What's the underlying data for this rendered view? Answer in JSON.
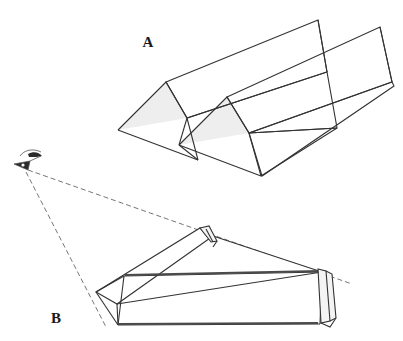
{
  "illustration": {
    "title": "Folded paper geometry figure",
    "background_color": "#ffffff",
    "stroke_color": "#333333",
    "shade_color": "#eeeeee",
    "dash_color": "#666666",
    "labels": {
      "panel_a": "A",
      "panel_b": "B"
    },
    "label_positions": {
      "panel_a": {
        "x": 148,
        "y": 47
      },
      "panel_b": {
        "x": 56,
        "y": 323
      }
    }
  },
  "figure_a": {
    "name": "accordion-fold-figure",
    "description": "Zigzag accordion folded sheet seen in oblique view with two shaded triangular end faces",
    "stroke_width": 1.1,
    "shaded_triangles": [
      {
        "points": "118,130 166,82 187,118"
      },
      {
        "points": "179,145 227,97 249,133"
      }
    ],
    "panels": [
      {
        "name": "rear-upper-panel",
        "points": "166,82 318,20 327,72 187,118"
      },
      {
        "name": "front-valley-panel",
        "points": "118,130 166,82 187,118 198,160"
      },
      {
        "name": "mid-upper-panel",
        "points": "187,118 327,72 337,128 249,133"
      },
      {
        "name": "second-rear-panel",
        "points": "227,97 380,27 392,82 249,133"
      },
      {
        "name": "front-lower-panel",
        "points": "179,145 227,97 249,133 261,175"
      },
      {
        "name": "outer-right-panel",
        "points": "249,133 392,82 394,86 262,176"
      }
    ]
  },
  "figure_b": {
    "name": "prism-with-eye-figure",
    "description": "Triangular prism with folded end flaps viewed from an eye position; dashed sight lines converge at the eye",
    "stroke_width": 1.1,
    "eye": {
      "name": "eye-icon",
      "x": 24,
      "y": 167,
      "description": "small stylised eye in profile marking the viewpoint"
    },
    "sight_lines": [
      {
        "name": "upper-sight-line",
        "x1": 28,
        "y1": 170,
        "x2": 350,
        "y2": 283
      },
      {
        "name": "lower-sight-line",
        "x1": 26,
        "y1": 172,
        "x2": 106,
        "y2": 325
      }
    ],
    "dash_pattern": "5,3",
    "prism_faces": [
      {
        "name": "top-slanted-face",
        "points": "96,292 200,228 213,236 117,304"
      },
      {
        "name": "upper-long-face",
        "points": "117,304 213,236 322,272 124,276"
      },
      {
        "name": "front-long-face",
        "points": "124,276 322,272 320,324 118,325"
      },
      {
        "name": "left-end-triangle",
        "points": "96,292 124,276 118,325"
      },
      {
        "name": "lower-base-face",
        "points": "118,325 320,324 322,272 124,276"
      }
    ],
    "flaps": [
      {
        "name": "top-corner-flap",
        "points": "200,228 209,226 216,240 211,241"
      },
      {
        "name": "right-end-flap-outer",
        "points": "318,270 325,271 328,320 320,323"
      },
      {
        "name": "right-end-flap-inner",
        "points": "325,271 331,273 334,319 328,320"
      }
    ]
  }
}
